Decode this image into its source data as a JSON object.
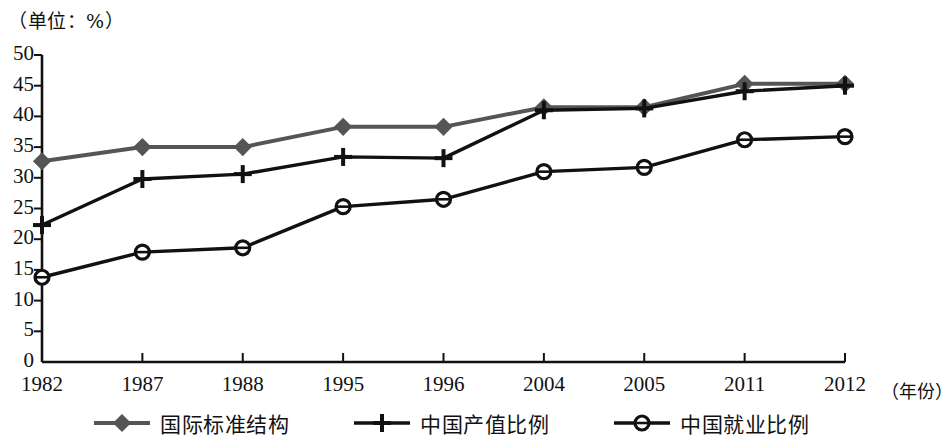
{
  "chart_data": {
    "type": "line",
    "title": "",
    "unit_note": "（单位：%）",
    "xlabel": "（年份）",
    "ylabel": "",
    "categories": [
      "1982",
      "1987",
      "1988",
      "1995",
      "1996",
      "2004",
      "2005",
      "2011",
      "2012"
    ],
    "ylim": [
      0,
      50
    ],
    "yticks": [
      "0",
      "5",
      "10",
      "15",
      "20",
      "25",
      "30",
      "35",
      "40",
      "45",
      "50"
    ],
    "grid": false,
    "legend_position": "bottom",
    "series": [
      {
        "name": "国际标准结构",
        "marker": "diamond",
        "color": "#555555",
        "values": [
          32.7,
          35.0,
          35.0,
          38.3,
          38.3,
          41.5,
          41.5,
          45.3,
          45.3
        ]
      },
      {
        "name": "中国产值比例",
        "marker": "plus",
        "color": "#111111",
        "values": [
          22.3,
          29.8,
          30.6,
          33.4,
          33.2,
          41.0,
          41.3,
          44.1,
          45.0
        ]
      },
      {
        "name": "中国就业比例",
        "marker": "circle",
        "color": "#111111",
        "values": [
          13.8,
          17.9,
          18.6,
          25.3,
          26.5,
          31.0,
          31.7,
          36.2,
          36.7
        ]
      }
    ]
  },
  "axis": {
    "x_title": "（年份）"
  }
}
